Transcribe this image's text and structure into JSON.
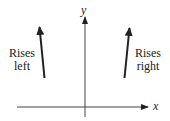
{
  "diagram": {
    "title": "",
    "axes": {
      "x_label": "x",
      "y_label": "y"
    },
    "annotations": [
      {
        "id": "left",
        "line1": "Rises",
        "line2": "left",
        "direction": "up, tilted left"
      },
      {
        "id": "right",
        "line1": "Rises",
        "line2": "right",
        "direction": "up, tilted right"
      }
    ],
    "colors": {
      "stroke": "#222222",
      "background": "#ffffff"
    }
  }
}
